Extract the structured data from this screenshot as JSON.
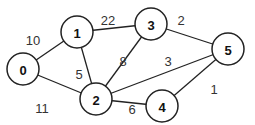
{
  "graph": {
    "nodes": [
      {
        "id": "0",
        "label": "0",
        "x": 23,
        "y": 69
      },
      {
        "id": "1",
        "label": "1",
        "x": 77,
        "y": 32
      },
      {
        "id": "2",
        "label": "2",
        "x": 96,
        "y": 99
      },
      {
        "id": "3",
        "label": "3",
        "x": 151,
        "y": 24
      },
      {
        "id": "4",
        "label": "4",
        "x": 162,
        "y": 106
      },
      {
        "id": "5",
        "label": "5",
        "x": 228,
        "y": 49
      }
    ],
    "edges": [
      {
        "from": "0",
        "to": "1",
        "weight": "10",
        "lx": 33,
        "ly": 40
      },
      {
        "from": "0",
        "to": "2",
        "weight": "11",
        "lx": 42,
        "ly": 108
      },
      {
        "from": "1",
        "to": "2",
        "weight": "5",
        "lx": 79,
        "ly": 74
      },
      {
        "from": "1",
        "to": "3",
        "weight": "22",
        "lx": 108,
        "ly": 20
      },
      {
        "from": "2",
        "to": "3",
        "weight": "8",
        "lx": 123,
        "ly": 61
      },
      {
        "from": "2",
        "to": "5",
        "weight": "3",
        "lx": 168,
        "ly": 61
      },
      {
        "from": "2",
        "to": "4",
        "weight": "6",
        "lx": 132,
        "ly": 109
      },
      {
        "from": "3",
        "to": "5",
        "weight": "2",
        "lx": 181,
        "ly": 20
      },
      {
        "from": "4",
        "to": "5",
        "weight": "1",
        "lx": 214,
        "ly": 89
      }
    ]
  }
}
